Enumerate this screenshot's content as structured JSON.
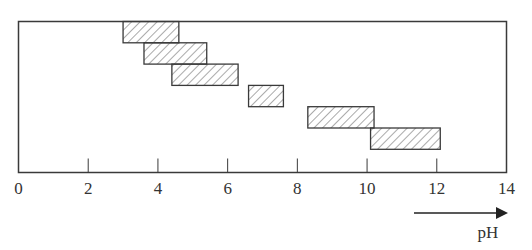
{
  "chart_data": {
    "type": "range-bar",
    "title": "",
    "xlabel": "pH",
    "ylabel": "",
    "xlim": [
      0,
      14
    ],
    "xticks": [
      0,
      2,
      4,
      6,
      8,
      10,
      12,
      14
    ],
    "xtick_labels": [
      "0",
      "2",
      "4",
      "6",
      "8",
      "10",
      "12",
      "14"
    ],
    "grid": false,
    "legend": null,
    "fill_pattern": "diagonal-hatch",
    "series": [
      {
        "name": "range-1",
        "row": 1,
        "start": 3.0,
        "end": 4.6
      },
      {
        "name": "range-2",
        "row": 2,
        "start": 3.6,
        "end": 5.4
      },
      {
        "name": "range-3",
        "row": 3,
        "start": 4.4,
        "end": 6.3
      },
      {
        "name": "range-4",
        "row": 4,
        "start": 6.6,
        "end": 7.6
      },
      {
        "name": "range-5",
        "row": 5,
        "start": 8.3,
        "end": 10.2
      },
      {
        "name": "range-6",
        "row": 6,
        "start": 10.1,
        "end": 12.1
      }
    ],
    "annotations": [
      {
        "type": "arrow",
        "direction": "right",
        "label": "pH",
        "meaning": "increasing pH"
      }
    ]
  },
  "colors": {
    "frame": "#3a3a3a",
    "box_stroke": "#3a3a3a",
    "hatch": "#555555",
    "background": "#ffffff"
  }
}
